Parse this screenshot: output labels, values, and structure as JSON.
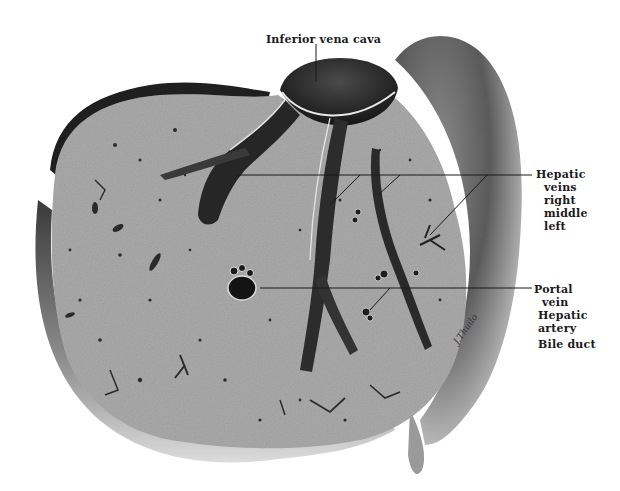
{
  "figure": {
    "colors": {
      "background": "#ffffff",
      "parenchyma": "#a9a9a9",
      "capsule_dark": "#2b2b2b",
      "vessel_dark": "#1e1e1e",
      "lobe_shading": "#6e6e6e",
      "leader_line": "#1a1a1a"
    }
  },
  "labels": {
    "inferior_vena_cava": "Inferior vena cava",
    "hepatic_veins": {
      "title": "Hepatic",
      "line2": "veins",
      "right": "right",
      "middle": "middle",
      "left": "left"
    },
    "portal_group": {
      "portal": "Portal",
      "vein": "vein",
      "hepatic": "Hepatic",
      "artery": "artery",
      "bile_duct": "Bile duct"
    }
  }
}
